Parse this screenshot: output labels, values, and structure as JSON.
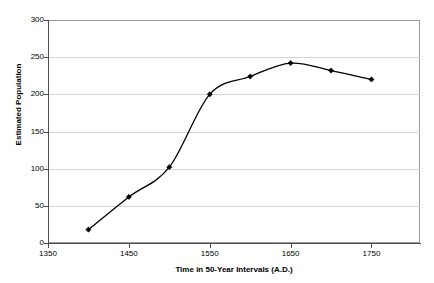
{
  "chart_data": {
    "type": "line",
    "title": "",
    "xlabel": "Time in 50-Year Intervals (A.D.)",
    "ylabel": "Estimated Population",
    "x": [
      1400,
      1450,
      1500,
      1550,
      1600,
      1650,
      1700,
      1750
    ],
    "values": [
      18,
      62,
      102,
      200,
      224,
      242,
      232,
      220
    ],
    "series": [
      {
        "name": "Estimated Population",
        "x": [
          1400,
          1450,
          1500,
          1550,
          1600,
          1650,
          1700,
          1750
        ],
        "values": [
          18,
          62,
          102,
          200,
          224,
          242,
          232,
          220
        ]
      }
    ],
    "xlim": [
      1350,
      1810
    ],
    "ylim": [
      0,
      300
    ],
    "xticks": [
      1350,
      1450,
      1550,
      1650,
      1750
    ],
    "xticklabels": [
      "1350",
      "1450",
      "1550",
      "1650",
      "1750"
    ],
    "yticks": [
      0,
      50,
      100,
      150,
      200,
      250,
      300
    ],
    "yticklabels": [
      "0",
      "50",
      "100",
      "150",
      "200",
      "250",
      "300"
    ],
    "grid": "horizontal",
    "legend": "none",
    "marker": "diamond",
    "line_color": "#000000",
    "grid_color": "#d6d6d6",
    "axis_color": "#4d4d4d",
    "background_color": "#ffffff",
    "smoothing": true
  }
}
